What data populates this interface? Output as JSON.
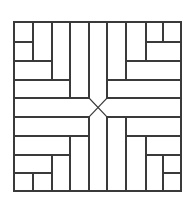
{
  "diagram": {
    "type": "parquet-floor-pattern",
    "colors": {
      "background": "#ffffff",
      "stroke": "#3a3a3a"
    },
    "stroke_width": 1.2,
    "frame": {
      "x": 14,
      "y": 22,
      "w": 167,
      "h": 169
    },
    "segments": [
      {
        "name": "ul-v-33",
        "x1": 33,
        "y1": 22,
        "x2": 33,
        "y2": 61
      },
      {
        "name": "ul-h-42",
        "x1": 14,
        "y1": 42,
        "x2": 33,
        "y2": 42
      },
      {
        "name": "ul-h-61",
        "x1": 14,
        "y1": 61,
        "x2": 52,
        "y2": 61
      },
      {
        "name": "ul-v-52",
        "x1": 52,
        "y1": 22,
        "x2": 52,
        "y2": 80
      },
      {
        "name": "ul-h-80",
        "x1": 14,
        "y1": 80,
        "x2": 70,
        "y2": 80
      },
      {
        "name": "ul-v-70",
        "x1": 70,
        "y1": 22,
        "x2": 70,
        "y2": 98
      },
      {
        "name": "l-h-98",
        "x1": 14,
        "y1": 98,
        "x2": 89,
        "y2": 98
      },
      {
        "name": "t-v-89",
        "x1": 89,
        "y1": 22,
        "x2": 89,
        "y2": 98
      },
      {
        "name": "t-v-107",
        "x1": 107,
        "y1": 22,
        "x2": 107,
        "y2": 98
      },
      {
        "name": "ur-v-163",
        "x1": 163,
        "y1": 22,
        "x2": 163,
        "y2": 42
      },
      {
        "name": "ur-h-42",
        "x1": 146,
        "y1": 42,
        "x2": 181,
        "y2": 42
      },
      {
        "name": "ur-v-146",
        "x1": 146,
        "y1": 22,
        "x2": 146,
        "y2": 61
      },
      {
        "name": "ur-h-61",
        "x1": 126,
        "y1": 61,
        "x2": 181,
        "y2": 61
      },
      {
        "name": "ur-v-126",
        "x1": 126,
        "y1": 22,
        "x2": 126,
        "y2": 80
      },
      {
        "name": "ur-h-80",
        "x1": 107,
        "y1": 80,
        "x2": 181,
        "y2": 80
      },
      {
        "name": "r-h-98",
        "x1": 107,
        "y1": 98,
        "x2": 181,
        "y2": 98
      },
      {
        "name": "l-h-117",
        "x1": 14,
        "y1": 117,
        "x2": 89,
        "y2": 117
      },
      {
        "name": "ll-h-136",
        "x1": 14,
        "y1": 136,
        "x2": 89,
        "y2": 136
      },
      {
        "name": "ll-v-70",
        "x1": 70,
        "y1": 136,
        "x2": 70,
        "y2": 191
      },
      {
        "name": "ll-h-155",
        "x1": 14,
        "y1": 155,
        "x2": 70,
        "y2": 155
      },
      {
        "name": "ll-v-52",
        "x1": 52,
        "y1": 155,
        "x2": 52,
        "y2": 191
      },
      {
        "name": "ll-h-173",
        "x1": 14,
        "y1": 173,
        "x2": 52,
        "y2": 173
      },
      {
        "name": "ll-v-33",
        "x1": 33,
        "y1": 173,
        "x2": 33,
        "y2": 191
      },
      {
        "name": "b-v-89",
        "x1": 89,
        "y1": 117,
        "x2": 89,
        "y2": 191
      },
      {
        "name": "b-v-107",
        "x1": 107,
        "y1": 117,
        "x2": 107,
        "y2": 191
      },
      {
        "name": "r-h-117",
        "x1": 107,
        "y1": 117,
        "x2": 181,
        "y2": 117
      },
      {
        "name": "lr-v-126",
        "x1": 126,
        "y1": 117,
        "x2": 126,
        "y2": 191
      },
      {
        "name": "lr-h-136",
        "x1": 126,
        "y1": 136,
        "x2": 181,
        "y2": 136
      },
      {
        "name": "lr-v-146",
        "x1": 146,
        "y1": 136,
        "x2": 146,
        "y2": 191
      },
      {
        "name": "lr-h-155",
        "x1": 146,
        "y1": 155,
        "x2": 181,
        "y2": 155
      },
      {
        "name": "lr-v-163",
        "x1": 163,
        "y1": 155,
        "x2": 163,
        "y2": 191
      },
      {
        "name": "lr-h-173",
        "x1": 163,
        "y1": 173,
        "x2": 181,
        "y2": 173
      }
    ],
    "diagonals": [
      {
        "name": "center-diag-a",
        "x1": 89,
        "y1": 98,
        "x2": 107,
        "y2": 117
      },
      {
        "name": "center-diag-b",
        "x1": 107,
        "y1": 98,
        "x2": 89,
        "y2": 117
      }
    ]
  }
}
